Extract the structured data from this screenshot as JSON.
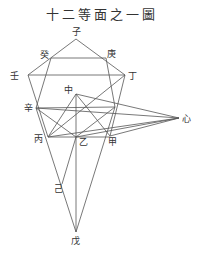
{
  "title": "十二等面之一圖",
  "points": {
    "zi": {
      "label": "子",
      "x": 76,
      "y": 39,
      "lx": 72,
      "ly": 35
    },
    "gui": {
      "label": "癸",
      "x": 51,
      "y": 58,
      "lx": 40,
      "ly": 58
    },
    "geng": {
      "label": "庚",
      "x": 106,
      "y": 58,
      "lx": 107,
      "ly": 57
    },
    "ren": {
      "label": "壬",
      "x": 28,
      "y": 75,
      "lx": 10,
      "ly": 79
    },
    "ding": {
      "label": "丁",
      "x": 125,
      "y": 75,
      "lx": 128,
      "ly": 79
    },
    "zhong": {
      "label": "中",
      "x": 76,
      "y": 94,
      "lx": 64,
      "ly": 93
    },
    "xin": {
      "label": "辛",
      "x": 36,
      "y": 108,
      "lx": 24,
      "ly": 111
    },
    "xinH": {
      "label": "心",
      "x": 179,
      "y": 118,
      "lx": 182,
      "ly": 122
    },
    "bing": {
      "label": "丙",
      "x": 48,
      "y": 137,
      "lx": 34,
      "ly": 142
    },
    "yi": {
      "label": "乙",
      "x": 76,
      "y": 137,
      "lx": 79,
      "ly": 145
    },
    "jia": {
      "label": "甲",
      "x": 110,
      "y": 136,
      "lx": 108,
      "ly": 145
    },
    "ji": {
      "label": "己",
      "x": 62,
      "y": 184,
      "lx": 54,
      "ly": 192
    },
    "wu": {
      "label": "戊",
      "x": 76,
      "y": 232,
      "lx": 71,
      "ly": 244
    },
    "p1": {
      "label": "",
      "x": 115,
      "y": 107
    }
  }
}
